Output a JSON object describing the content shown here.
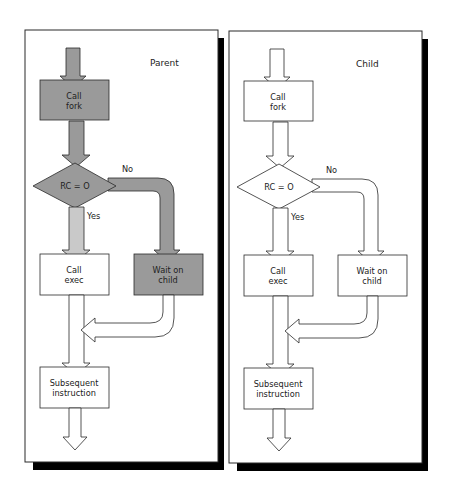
{
  "figure": {
    "colors": {
      "parent_fill": "#9a9a9a",
      "parent_light_fill": "#c9c9c9",
      "child_fill": "#ffffff",
      "stroke": "#2a2a2a",
      "shadow": "#000000"
    }
  },
  "panels": [
    {
      "id": "parent",
      "title": "Parent",
      "nodes": {
        "fork": {
          "line1": "Call",
          "line2": "fork"
        },
        "decision": {
          "label": "RC = O"
        },
        "exec": {
          "line1": "Call",
          "line2": "exec"
        },
        "wait": {
          "line1": "Wait on",
          "line2": "child"
        },
        "subsequent": {
          "line1": "Subsequent",
          "line2": "instruction"
        }
      },
      "edges": {
        "yes_label": "Yes",
        "no_label": "No"
      },
      "active_path": [
        "start",
        "fork",
        "decision",
        "no",
        "wait",
        "subsequent",
        "end"
      ]
    },
    {
      "id": "child",
      "title": "Child",
      "nodes": {
        "fork": {
          "line1": "Call",
          "line2": "fork"
        },
        "decision": {
          "label": "RC = O"
        },
        "exec": {
          "line1": "Call",
          "line2": "exec"
        },
        "wait": {
          "line1": "Wait on",
          "line2": "child"
        },
        "subsequent": {
          "line1": "Subsequent",
          "line2": "instruction"
        }
      },
      "edges": {
        "yes_label": "Yes",
        "no_label": "No"
      },
      "active_path": []
    }
  ]
}
